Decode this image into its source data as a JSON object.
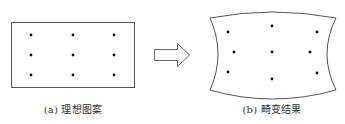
{
  "figure": {
    "panels": [
      {
        "id": "a",
        "caption": "(a) 理想图案",
        "shape": "rectangle",
        "dots": [
          {
            "x": 31,
            "y": 35
          },
          {
            "x": 73,
            "y": 35
          },
          {
            "x": 114,
            "y": 35
          },
          {
            "x": 31,
            "y": 55
          },
          {
            "x": 73,
            "y": 55
          },
          {
            "x": 114,
            "y": 55
          },
          {
            "x": 31,
            "y": 75
          },
          {
            "x": 73,
            "y": 75
          },
          {
            "x": 114,
            "y": 75
          }
        ]
      },
      {
        "id": "b",
        "caption": "(b) 畸变结果",
        "shape": "distorted-pincushion",
        "dots": [
          {
            "x": 228,
            "y": 32
          },
          {
            "x": 272,
            "y": 26
          },
          {
            "x": 317,
            "y": 32
          },
          {
            "x": 234,
            "y": 52
          },
          {
            "x": 272,
            "y": 52
          },
          {
            "x": 310,
            "y": 52
          },
          {
            "x": 228,
            "y": 72
          },
          {
            "x": 272,
            "y": 79
          },
          {
            "x": 317,
            "y": 73
          }
        ]
      }
    ],
    "arrow": {
      "direction": "right",
      "icon": "hollow-right-arrow-icon"
    },
    "colors": {
      "stroke": "#555555",
      "dot": "#111111",
      "text": "#333333",
      "background": "#ffffff"
    }
  }
}
